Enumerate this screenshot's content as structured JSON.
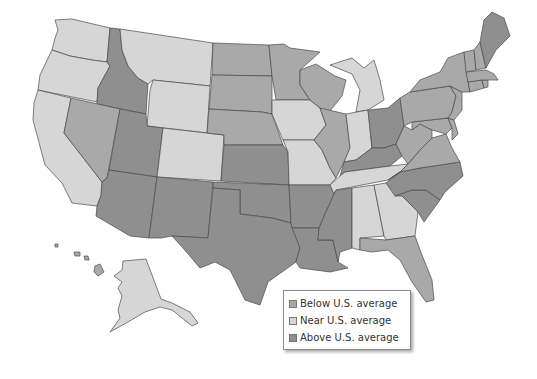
{
  "legend": {
    "items": [
      {
        "key": "below",
        "label": "Below U.S. average",
        "color": "#a9a9a9"
      },
      {
        "key": "near",
        "label": "Near U.S. average",
        "color": "#d6d6d6"
      },
      {
        "key": "above",
        "label": "Above U.S. average",
        "color": "#8f8f8f"
      }
    ]
  },
  "states": {
    "WA": "near",
    "OR": "near",
    "CA": "near",
    "ID": "above",
    "MT": "near",
    "WY": "near",
    "NV": "below",
    "UT": "above",
    "CO": "near",
    "AZ": "above",
    "NM": "above",
    "ND": "below",
    "SD": "below",
    "NE": "below",
    "KS": "above",
    "OK": "above",
    "TX": "above",
    "MN": "below",
    "IA": "near",
    "MO": "near",
    "AR": "above",
    "LA": "above",
    "WI": "below",
    "IL": "below",
    "MI": "near",
    "IN": "near",
    "OH": "above",
    "KY": "above",
    "TN": "near",
    "MS": "above",
    "AL": "near",
    "GA": "near",
    "FL": "below",
    "SC": "above",
    "NC": "above",
    "VA": "below",
    "WV": "below",
    "MD": "below",
    "DE": "below",
    "PA": "below",
    "NJ": "below",
    "NY": "below",
    "CT": "below",
    "RI": "below",
    "MA": "below",
    "VT": "below",
    "NH": "below",
    "ME": "above",
    "AK": "near",
    "HI": "below"
  }
}
